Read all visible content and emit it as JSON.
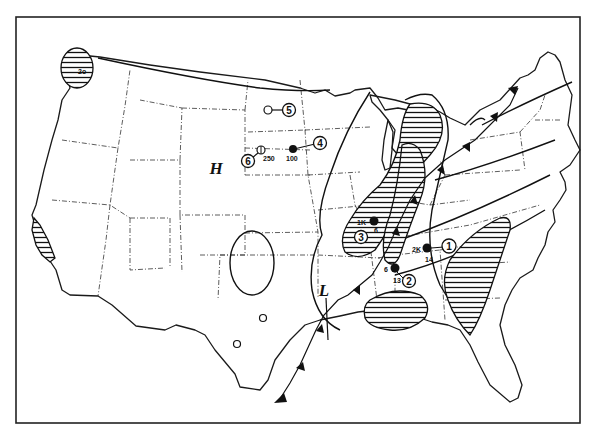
{
  "map": {
    "subject": "Continental United States weather map",
    "colors": {
      "ink": "#111111",
      "background": "#ffffff"
    },
    "pressure_centers": [
      {
        "label": "H",
        "type": "high-pressure",
        "x": 216,
        "y": 168
      },
      {
        "label": "L",
        "type": "low-pressure",
        "x": 324,
        "y": 292
      }
    ],
    "stations": [
      {
        "number": "1",
        "plot": "filled",
        "label_left": "2K",
        "label_below": "14"
      },
      {
        "number": "2",
        "plot": "filled",
        "label_left": "6",
        "label_below": "13"
      },
      {
        "number": "3",
        "plot": "filled",
        "label_left": "1K",
        "label_below": "6"
      },
      {
        "number": "4",
        "plot": "filled",
        "label_below": "100"
      },
      {
        "number": "5",
        "plot": "open"
      },
      {
        "number": "6",
        "plot": "open-partial",
        "label_below": "250"
      }
    ],
    "annotations": {
      "pnw_label": "2o"
    },
    "features": [
      "cold-front",
      "hatched-precipitation-areas",
      "isolines",
      "state-boundaries"
    ]
  }
}
